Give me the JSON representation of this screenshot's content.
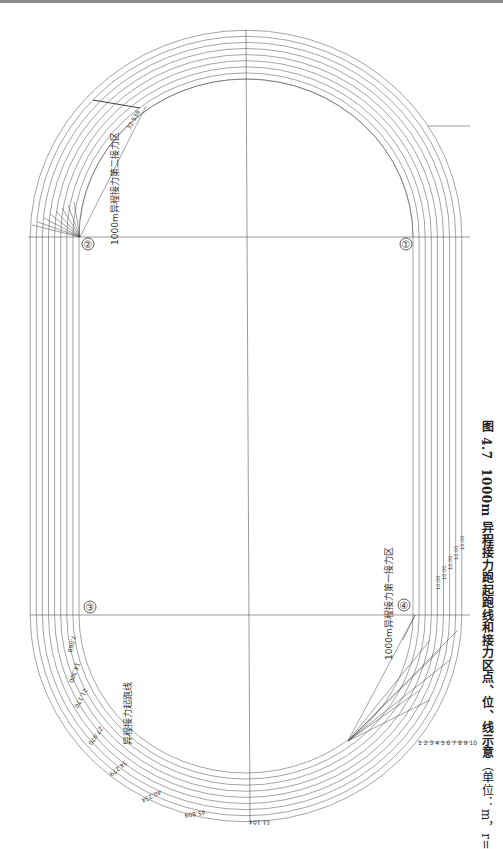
{
  "figure": {
    "number": "图 4.7",
    "title": "1000m 异程接力跑起跑线和接力区点、位、线示意",
    "units": "（单位：m，r=36.00）"
  },
  "markers": [
    {
      "id": "1",
      "label": "①"
    },
    {
      "id": "2",
      "label": "②"
    },
    {
      "id": "3",
      "label": "③"
    },
    {
      "id": "4",
      "label": "④"
    }
  ],
  "zone_labels": {
    "second_zone": "1000m异程接力第二接力区",
    "first_zone": "1000m异程接力第一接力区",
    "start_line": "异程接力起跑线"
  },
  "lane_numbers": "1 2 3 4 5 6 7 8 9 10",
  "start_line_staggers": [
    "0",
    "7.068",
    "14.300",
    "21.170",
    "27.970",
    "34.279",
    "40.234",
    "45.809",
    "51.104"
  ],
  "second_zone_values": [
    "32.539",
    "10.00"
  ],
  "first_zone_values": {
    "inner": [
      "4.004",
      "10.332",
      "15.855",
      "22.535",
      "64.627"
    ],
    "mid": [
      "1.320",
      "6.860",
      "13.151",
      "18.863",
      "9.515",
      "14.237"
    ],
    "outer": [
      "1.340",
      "7.218",
      "4.511",
      "1.108",
      "8.017",
      "8.948",
      "11.855",
      "16.844",
      "21.468",
      "31.377",
      "33.540"
    ],
    "straight": [
      "10.00",
      "10.00",
      "10.00",
      "10.00",
      "10.00",
      "10.00"
    ]
  },
  "colors": {
    "line": "#555555",
    "text": "#222222"
  }
}
